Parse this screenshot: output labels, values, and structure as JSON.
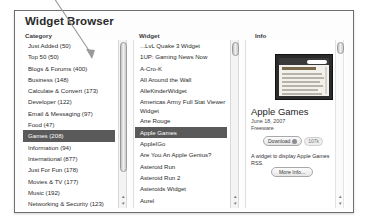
{
  "window": {
    "title": "Widget Browser"
  },
  "headers": {
    "category": "Category",
    "widget": "Widget",
    "info": "Info"
  },
  "category_list": {
    "items": [
      {
        "label": "Just Added (50)",
        "selected": false
      },
      {
        "label": "Top 50 (50)",
        "selected": false
      },
      {
        "label": "Blogs & Forums (400)",
        "selected": false
      },
      {
        "label": "Business (148)",
        "selected": false
      },
      {
        "label": "Calculate & Convert (173)",
        "selected": false
      },
      {
        "label": "Developer (122)",
        "selected": false
      },
      {
        "label": "Email & Messaging (97)",
        "selected": false
      },
      {
        "label": "Food (47)",
        "selected": false
      },
      {
        "label": "Games (208)",
        "selected": true
      },
      {
        "label": "Information (94)",
        "selected": false
      },
      {
        "label": "International (877)",
        "selected": false
      },
      {
        "label": "Just For Fun (178)",
        "selected": false
      },
      {
        "label": "Movies & TV (177)",
        "selected": false
      },
      {
        "label": "Music (192)",
        "selected": false
      },
      {
        "label": "Networking & Security (123)",
        "selected": false
      },
      {
        "label": "News (290)",
        "selected": false
      },
      {
        "label": "Radio & Podcasts (222)",
        "selected": false
      },
      {
        "label": "Reference (230)",
        "selected": false
      }
    ]
  },
  "widget_list": {
    "items": [
      {
        "label": "...LvL Quake 3 Widget",
        "selected": false,
        "two_line": false
      },
      {
        "label": "1UP: Gaming News Now",
        "selected": false,
        "two_line": false
      },
      {
        "label": "A-Cro-K",
        "selected": false,
        "two_line": false
      },
      {
        "label": "All Around the Wall",
        "selected": false,
        "two_line": false
      },
      {
        "label": "AlleKinderWidget",
        "selected": false,
        "two_line": false
      },
      {
        "label": "Americas Army Full Stat Viewer Widget",
        "selected": false,
        "two_line": true
      },
      {
        "label": "Ane Rouge",
        "selected": false,
        "two_line": false
      },
      {
        "label": "Apple Games",
        "selected": true,
        "two_line": false
      },
      {
        "label": "AppleIGo",
        "selected": false,
        "two_line": false
      },
      {
        "label": "Are You An Apple Genius?",
        "selected": false,
        "two_line": false
      },
      {
        "label": "Asteroid Run",
        "selected": false,
        "two_line": false
      },
      {
        "label": "Asteroid Run 2",
        "selected": false,
        "two_line": false
      },
      {
        "label": "Asteroids Widget",
        "selected": false,
        "two_line": false
      },
      {
        "label": "Aurel",
        "selected": false,
        "two_line": false
      },
      {
        "label": "autok: Autoquartett Widget",
        "selected": false,
        "two_line": false
      },
      {
        "label": "Axis & Allies Miniatures Widget",
        "selected": false,
        "two_line": false
      },
      {
        "label": "Banana Warehouse",
        "selected": false,
        "two_line": false
      },
      {
        "label": "Basketball",
        "selected": false,
        "two_line": false
      }
    ]
  },
  "info": {
    "title": "Apple Games",
    "date": "June 18, 2007",
    "license": "Freeware",
    "download_label": "Download",
    "download_icon": "download-circle-icon",
    "download_size": "107k",
    "description": "A widget to display Apple Games RSS.",
    "more_info_label": "More Info..."
  },
  "scrollbars": {
    "down_arrow_glyph": "▾",
    "up_arrow_glyph": "▴"
  },
  "annotation": {
    "name": "pointer-arrow"
  }
}
